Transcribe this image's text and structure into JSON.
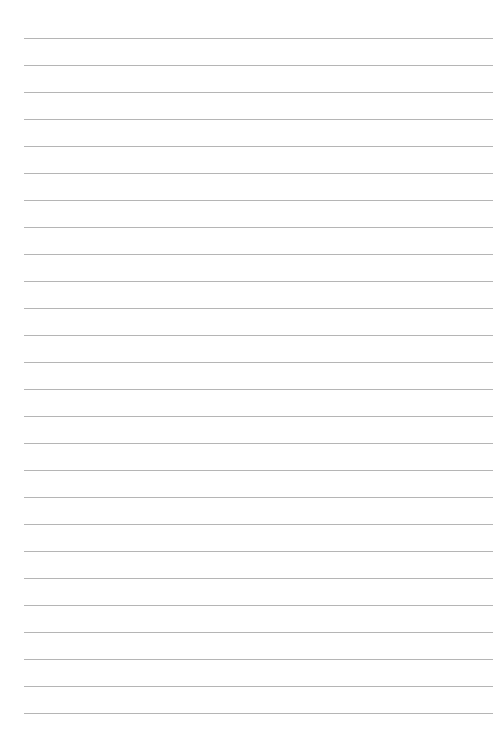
{
  "page": {
    "type": "lined-paper",
    "background_color": "#ffffff",
    "line_color": "#b5b5b5",
    "line_count": 26,
    "first_line_y": 38,
    "line_spacing": 27,
    "left_margin": 24
  }
}
